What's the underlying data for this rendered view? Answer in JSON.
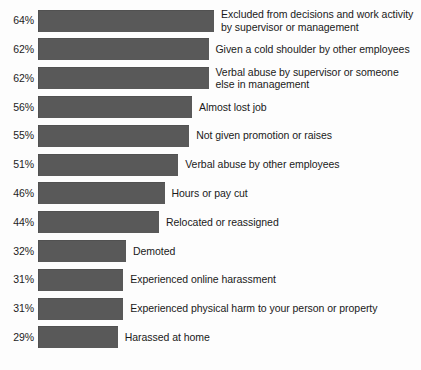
{
  "chart_data": {
    "type": "bar",
    "orientation": "horizontal",
    "title": "",
    "subtitle": "",
    "xlabel": "",
    "ylabel": "",
    "xlim": [
      0,
      100
    ],
    "grid": false,
    "legend": null,
    "value_suffix": "%",
    "categories": [
      "Excluded from decisions and work activity\nby supervisor or management",
      "Given a cold shoulder by other employees",
      "Verbal abuse by supervisor or someone\nelse in management",
      "Almost lost job",
      "Not given promotion or raises",
      "Verbal abuse by other employees",
      "Hours or pay cut",
      "Relocated or reassigned",
      "Demoted",
      "Experienced online harassment",
      "Experienced physical harm to your person or property",
      "Harassed at home"
    ],
    "values": [
      64,
      62,
      62,
      56,
      55,
      51,
      46,
      44,
      32,
      31,
      31,
      29
    ],
    "value_labels": [
      "64%",
      "62%",
      "62%",
      "56%",
      "55%",
      "51%",
      "46%",
      "44%",
      "32%",
      "31%",
      "31%",
      "29%"
    ],
    "colors": {
      "bar": "#595959",
      "background": "#fdfdfd",
      "text": "#1a1a1a"
    },
    "rows": [
      {
        "value_label": "64%",
        "value": 64,
        "label": "Excluded from decisions and work activity\nby supervisor or management"
      },
      {
        "value_label": "62%",
        "value": 62,
        "label": "Given a cold shoulder by other employees"
      },
      {
        "value_label": "62%",
        "value": 62,
        "label": "Verbal abuse by supervisor or someone\nelse in management"
      },
      {
        "value_label": "56%",
        "value": 56,
        "label": "Almost lost job"
      },
      {
        "value_label": "55%",
        "value": 55,
        "label": "Not given promotion or raises"
      },
      {
        "value_label": "51%",
        "value": 51,
        "label": "Verbal abuse by other employees"
      },
      {
        "value_label": "46%",
        "value": 46,
        "label": "Hours or pay cut"
      },
      {
        "value_label": "44%",
        "value": 44,
        "label": "Relocated or reassigned"
      },
      {
        "value_label": "32%",
        "value": 32,
        "label": "Demoted"
      },
      {
        "value_label": "31%",
        "value": 31,
        "label": "Experienced online harassment"
      },
      {
        "value_label": "31%",
        "value": 31,
        "label": "Experienced physical harm to your person or property"
      },
      {
        "value_label": "29%",
        "value": 29,
        "label": "Harassed at home"
      }
    ]
  },
  "layout": {
    "row_pitch": 28.8,
    "first_row_top": 6,
    "px_per_percent": 2.75,
    "bar_height": 22
  }
}
